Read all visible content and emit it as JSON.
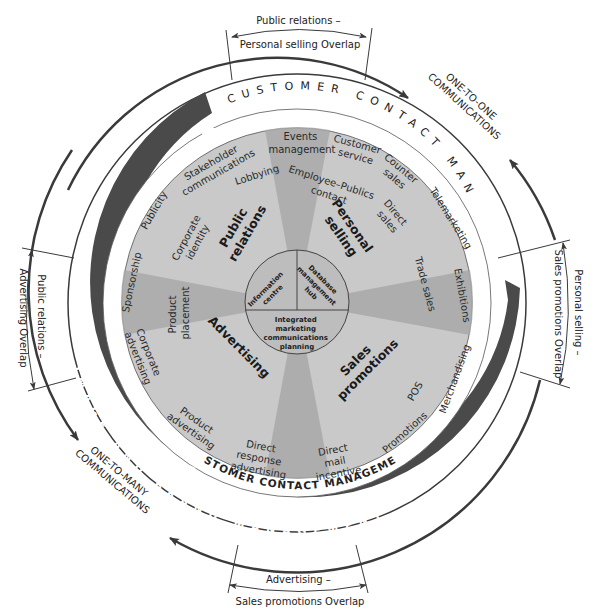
{
  "diagram": {
    "center_hub": {
      "top_left": [
        "Information",
        "centre"
      ],
      "top_right": [
        "Database",
        "management",
        "hub"
      ],
      "bottom": [
        "Integrated",
        "marketing",
        "communications",
        "planning"
      ]
    },
    "segments": {
      "public_relations": [
        "Public",
        "relations"
      ],
      "personal_selling": [
        "Personal",
        "selling"
      ],
      "advertising": "Advertising",
      "sales_promotions": [
        "Sales",
        "promotions"
      ]
    },
    "activities": {
      "events_management": [
        "Events",
        "management"
      ],
      "customer_service": [
        "Customer",
        "service"
      ],
      "counter_sales": [
        "Counter",
        "sales"
      ],
      "telemarketing": "Telemarketing",
      "employee_publics_contact": [
        "Employee–Publics",
        "contact"
      ],
      "direct_sales": [
        "Direct",
        "sales"
      ],
      "trade_sales": "Trade sales",
      "exhibitions": "Exhibitions",
      "merchandising": "Merchandising",
      "pos": "POS",
      "promotions": "Promotions",
      "direct_mail_incentive": [
        "Direct",
        "mail",
        "incentive"
      ],
      "direct_response_advertising": [
        "Direct",
        "response",
        "advertising"
      ],
      "product_advertising": [
        "Product",
        "advertising"
      ],
      "corporate_advertising": [
        "Corporate",
        "advertising"
      ],
      "product_placement": [
        "Product",
        "placement"
      ],
      "sponsorship": "Sponsorship",
      "publicity": "Publicity",
      "corporate_identity": [
        "Corporate",
        "identity"
      ],
      "stakeholder_communications": [
        "Stakeholder",
        "communications"
      ],
      "lobbying": "Lobbying"
    },
    "rings": {
      "customer_contact_top": "CUSTOMER CONTACT MANAGEMENT",
      "customer_contact_bottom": "CUSTOMER CONTACT MANAGEMENT",
      "image_brand": "IMAGE AND BRAND MANAGEMENT"
    },
    "outer_labels": {
      "one_to_one": [
        "ONE-TO-ONE",
        "COMMUNICATIONS"
      ],
      "one_to_many": [
        "ONE-TO-MANY",
        "COMMUNICATIONS"
      ]
    },
    "overlaps": {
      "top": [
        "Public relations –",
        "Personal selling Overlap"
      ],
      "right": [
        "Personal selling –",
        "Sales promotions Overlap"
      ],
      "bottom": [
        "Advertising –",
        "Sales promotions Overlap"
      ],
      "left": [
        "Public relations –",
        "Advertising Overlap"
      ]
    },
    "colors": {
      "disc": "#c9c9c9",
      "disc_shadow": "#a6a6a6",
      "dark_band": "#4a4a4a",
      "line": "#333333",
      "background": "#ffffff"
    }
  }
}
